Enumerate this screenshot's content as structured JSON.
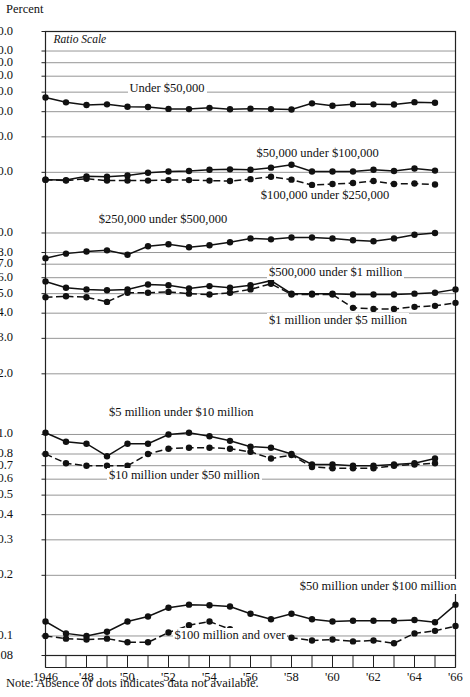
{
  "figure": {
    "y_axis_title": "Percent",
    "ratio_scale_note": "Ratio Scale",
    "note": "Note:  Absence of dots indicates data not available."
  },
  "chart_data": {
    "type": "line",
    "title": "Percent",
    "xlabel": "",
    "ylabel": "Percent",
    "yscale": "log",
    "ylim": [
      0.08,
      100.0
    ],
    "xlim": [
      1946,
      1966
    ],
    "grid": true,
    "legend": "inline-labels",
    "ytick_labels": [
      "100.0",
      "80.0",
      "70.0",
      "60.0",
      "50.0",
      "40.0",
      "30.0",
      "20.0",
      "10.0",
      "8.0",
      "7.0",
      "6.0",
      "5.0",
      "4.0",
      "3.0",
      "2.0",
      "1.0",
      "0.8",
      "0.7",
      "0.6",
      "0.5",
      "0.4",
      "0.3",
      "0.2",
      "0.1",
      "0.08"
    ],
    "ytick_values": [
      100.0,
      80.0,
      70.0,
      60.0,
      50.0,
      40.0,
      30.0,
      20.0,
      10.0,
      8.0,
      7.0,
      6.0,
      5.0,
      4.0,
      3.0,
      2.0,
      1.0,
      0.8,
      0.7,
      0.6,
      0.5,
      0.4,
      0.3,
      0.2,
      0.1,
      0.08
    ],
    "xtick_values": [
      1946,
      1947,
      1948,
      1949,
      1950,
      1951,
      1952,
      1953,
      1954,
      1955,
      1956,
      1957,
      1958,
      1959,
      1960,
      1961,
      1962,
      1963,
      1964,
      1965,
      1966
    ],
    "xtick_labels": [
      {
        "x": 1946,
        "label": "1946"
      },
      {
        "x": 1948,
        "label": "'48"
      },
      {
        "x": 1950,
        "label": "'50"
      },
      {
        "x": 1952,
        "label": "'52"
      },
      {
        "x": 1954,
        "label": "'54"
      },
      {
        "x": 1956,
        "label": "'56"
      },
      {
        "x": 1958,
        "label": "'58"
      },
      {
        "x": 1960,
        "label": "'60"
      },
      {
        "x": 1962,
        "label": "'62"
      },
      {
        "x": 1964,
        "label": "'64"
      },
      {
        "x": 1966,
        "label": "'66"
      }
    ],
    "x": [
      1946,
      1947,
      1948,
      1949,
      1950,
      1951,
      1952,
      1953,
      1954,
      1955,
      1956,
      1957,
      1958,
      1959,
      1960,
      1961,
      1962,
      1963,
      1964,
      1965,
      1966
    ],
    "series": [
      {
        "name": "Under $50,000",
        "style": "solid",
        "label_x": 1950.0,
        "label_y": 52.0,
        "values": [
          47.0,
          44.5,
          43.2,
          43.5,
          42.3,
          42.2,
          41.3,
          41.2,
          41.8,
          41.1,
          41.4,
          41.2,
          41.0,
          44.0,
          42.8,
          43.6,
          43.5,
          43.4,
          44.6,
          44.3,
          null
        ]
      },
      {
        "name": "$50,000 under $100,000",
        "style": "solid",
        "label_x": 1956.2,
        "label_y": 24.6,
        "values": [
          18.4,
          18.3,
          19.1,
          19.0,
          19.3,
          19.9,
          20.2,
          20.3,
          20.6,
          20.7,
          20.6,
          21.1,
          21.8,
          20.2,
          20.2,
          20.2,
          20.6,
          20.3,
          20.9,
          20.4,
          null
        ]
      },
      {
        "name": "$100,000 under $250,000",
        "style": "dashed",
        "label_x": 1956.4,
        "label_y": 15.3,
        "values": [
          18.4,
          18.2,
          18.6,
          18.2,
          18.2,
          18.2,
          18.3,
          18.3,
          18.2,
          18.1,
          18.5,
          19.0,
          18.4,
          17.3,
          17.5,
          17.7,
          18.1,
          17.5,
          17.6,
          17.4,
          null
        ]
      },
      {
        "name": "$250,000 under $500,000",
        "style": "solid",
        "label_x": 1948.5,
        "label_y": 11.6,
        "values": [
          7.5,
          7.9,
          8.1,
          8.2,
          7.8,
          8.6,
          8.8,
          8.5,
          8.7,
          9.0,
          9.4,
          9.3,
          9.5,
          9.5,
          9.4,
          9.2,
          9.1,
          9.4,
          9.8,
          10.0,
          null
        ]
      },
      {
        "name": "$500,000 under $1 million",
        "style": "solid",
        "label_x": 1956.8,
        "label_y": 6.35,
        "values": [
          5.75,
          5.35,
          5.25,
          5.2,
          5.25,
          5.55,
          5.5,
          5.3,
          5.45,
          5.35,
          5.5,
          5.8,
          5.0,
          5.0,
          5.0,
          4.95,
          4.95,
          4.95,
          5.0,
          5.05,
          5.25
        ]
      },
      {
        "name": "$1 million under $5 million",
        "style": "dashed",
        "label_x": 1956.8,
        "label_y": 3.65,
        "values": [
          4.8,
          4.85,
          4.8,
          4.55,
          5.05,
          5.05,
          5.1,
          5.0,
          4.95,
          5.05,
          5.25,
          5.6,
          4.95,
          4.95,
          4.95,
          4.25,
          4.2,
          4.2,
          4.3,
          4.35,
          4.5
        ]
      },
      {
        "name": "$5 million under $10 million",
        "style": "solid",
        "label_x": 1949.0,
        "label_y": 1.28,
        "values": [
          1.02,
          0.92,
          0.9,
          0.78,
          0.9,
          0.9,
          1.0,
          1.02,
          0.98,
          0.93,
          0.87,
          0.86,
          0.8,
          0.71,
          0.71,
          0.7,
          0.7,
          0.71,
          0.72,
          0.76,
          null
        ]
      },
      {
        "name": "$10 million under $50 million",
        "style": "dashed",
        "label_x": 1949.0,
        "label_y": 0.62,
        "values": [
          0.8,
          0.72,
          0.7,
          0.7,
          0.7,
          0.8,
          0.85,
          0.86,
          0.86,
          0.85,
          0.82,
          0.76,
          0.79,
          0.69,
          0.68,
          0.68,
          0.68,
          0.7,
          0.71,
          0.72,
          null
        ]
      },
      {
        "name": "$50 million under $100 million",
        "style": "solid",
        "label_x": 1958.3,
        "label_y": 0.175,
        "values": [
          0.118,
          0.103,
          0.1,
          0.105,
          0.118,
          0.125,
          0.138,
          0.143,
          0.142,
          0.14,
          0.129,
          0.121,
          0.129,
          0.121,
          0.118,
          0.119,
          0.119,
          0.119,
          0.12,
          0.117,
          0.143
        ]
      },
      {
        "name": "$100 million and over",
        "style": "dashed",
        "label_x": 1952.2,
        "label_y": 0.1,
        "values": [
          0.1,
          0.097,
          0.096,
          0.097,
          0.093,
          0.093,
          0.104,
          0.113,
          0.118,
          0.108,
          0.105,
          0.105,
          0.098,
          0.095,
          0.096,
          0.094,
          0.095,
          0.092,
          0.103,
          0.106,
          0.112
        ]
      }
    ]
  }
}
